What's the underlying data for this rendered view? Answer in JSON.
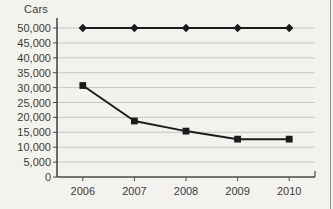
{
  "chart_data": {
    "type": "line",
    "title": "",
    "xlabel": "",
    "ylabel": "Cars",
    "categories": [
      "2006",
      "2007",
      "2008",
      "2009",
      "2010"
    ],
    "series": [
      {
        "name": "Flat reference",
        "marker": "diamond",
        "values": [
          50000,
          50000,
          50000,
          50000,
          50000
        ]
      },
      {
        "name": "Declining",
        "marker": "square",
        "values": [
          30700,
          18800,
          15400,
          12700,
          12700
        ]
      }
    ],
    "ylim": [
      0,
      50000
    ],
    "ytick_labels": [
      "50,000",
      "45,000",
      "40,000",
      "35,000",
      "30,000",
      "25,000",
      "20,000",
      "15,000",
      "10,000",
      "5,000",
      "0"
    ],
    "ytick_values": [
      50000,
      45000,
      40000,
      35000,
      30000,
      25000,
      20000,
      15000,
      10000,
      5000,
      0
    ],
    "grid": true,
    "legend": "none",
    "colors": {
      "background": "#f4f2ef",
      "gridline": "#c9c7c4",
      "axis": "#4a4a4a",
      "line": "#1c1c1c",
      "text": "#3a3a3a"
    }
  }
}
